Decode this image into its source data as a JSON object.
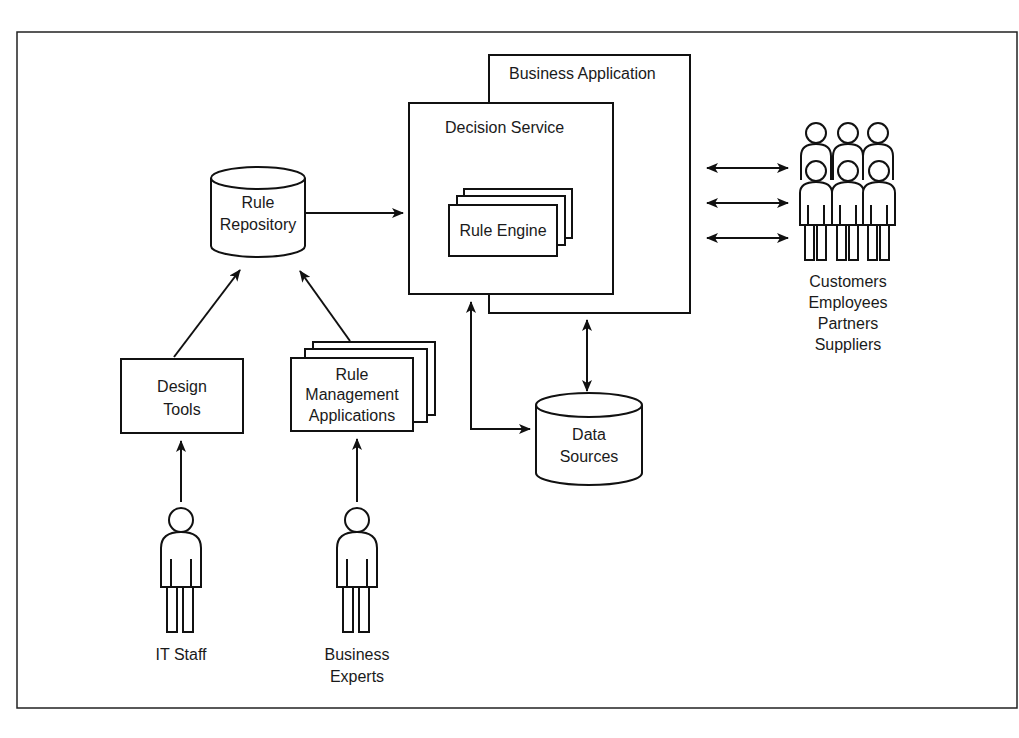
{
  "diagram": {
    "nodes": {
      "business_application": {
        "label": "Business Application"
      },
      "decision_service": {
        "label": "Decision Service"
      },
      "rule_engine": {
        "label": "Rule Engine"
      },
      "rule_repository": {
        "line1": "Rule",
        "line2": "Repository"
      },
      "design_tools": {
        "line1": "Design",
        "line2": "Tools"
      },
      "rule_management": {
        "line1": "Rule",
        "line2": "Management",
        "line3": "Applications"
      },
      "data_sources": {
        "line1": "Data",
        "line2": "Sources"
      },
      "it_staff": {
        "label": "IT Staff"
      },
      "business_experts": {
        "line1": "Business",
        "line2": "Experts"
      },
      "stakeholders": {
        "line1": "Customers",
        "line2": "Employees",
        "line3": "Partners",
        "line4": "Suppliers"
      }
    },
    "edges": [
      {
        "from": "Rule Repository",
        "to": "Decision Service",
        "type": "arrow"
      },
      {
        "from": "Design Tools",
        "to": "Rule Repository",
        "type": "arrow"
      },
      {
        "from": "Rule Management Applications",
        "to": "Rule Repository",
        "type": "arrow"
      },
      {
        "from": "IT Staff",
        "to": "Design Tools",
        "type": "arrow"
      },
      {
        "from": "Business Experts",
        "to": "Rule Management Applications",
        "type": "arrow"
      },
      {
        "from": "Decision Service",
        "to": "Data Sources",
        "type": "bidirectional"
      },
      {
        "from": "Business Application",
        "to": "Data Sources",
        "type": "bidirectional"
      },
      {
        "from": "Business Application",
        "to": "Customers/Employees/Partners/Suppliers",
        "type": "bidirectional",
        "count": 3
      }
    ]
  }
}
